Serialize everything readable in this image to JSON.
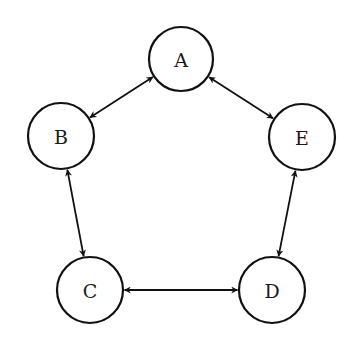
{
  "diagram": {
    "type": "directed-graph",
    "nodes": [
      {
        "id": "A",
        "label": "A",
        "cx": 181,
        "cy": 59,
        "r": 32
      },
      {
        "id": "B",
        "label": "B",
        "cx": 61,
        "cy": 136,
        "r": 33
      },
      {
        "id": "C",
        "label": "C",
        "cx": 90,
        "cy": 290,
        "r": 33
      },
      {
        "id": "D",
        "label": "D",
        "cx": 272,
        "cy": 290,
        "r": 33
      },
      {
        "id": "E",
        "label": "E",
        "cx": 302,
        "cy": 137,
        "r": 33
      }
    ],
    "edges": [
      {
        "from": "A",
        "to": "B",
        "bidirectional": true
      },
      {
        "from": "B",
        "to": "C",
        "bidirectional": true
      },
      {
        "from": "C",
        "to": "D",
        "bidirectional": true
      },
      {
        "from": "D",
        "to": "E",
        "bidirectional": true
      },
      {
        "from": "E",
        "to": "A",
        "bidirectional": true
      }
    ],
    "colors": {
      "stroke": "#111111",
      "background": "#ffffff",
      "text": "#1a1a1a"
    }
  }
}
